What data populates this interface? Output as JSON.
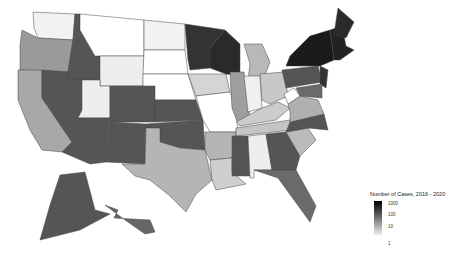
{
  "chart_data": {
    "type": "choropleth",
    "title": "",
    "legend": {
      "title": "Number of Cases, 2016 - 2020",
      "scale": "log",
      "ticks": [
        "1000",
        "100",
        "10",
        "1"
      ]
    },
    "states": {
      "WA": "#f2f2f2",
      "OR": "#9a9a9a",
      "CA": "#a8a8a8",
      "ID": "#555555",
      "NV": "#555555",
      "MT": "#ffffff",
      "WY": "#eeeeee",
      "UT": "#eeeeee",
      "AZ": "#555555",
      "CO": "#555555",
      "NM": "#555555",
      "ND": "#f2f2f2",
      "SD": "#ffffff",
      "NE": "#ffffff",
      "KS": "#555555",
      "OK": "#555555",
      "TX": "#b5b5b5",
      "MN": "#333333",
      "IA": "#d5d5d5",
      "MO": "#ffffff",
      "AR": "#b5b5b5",
      "LA": "#cfcfcf",
      "WI": "#2a2a2a",
      "IL": "#9e9e9e",
      "MI": "#b8b8b8",
      "IN": "#f0f0f0",
      "OH": "#c8c8c8",
      "KY": "#cccccc",
      "TN": "#c4c4c4",
      "MS": "#555555",
      "AL": "#eeeeee",
      "GA": "#555555",
      "FL": "#6a6a6a",
      "SC": "#bbbbbb",
      "NC": "#555555",
      "VA": "#b0b0b0",
      "WV": "#ffffff",
      "PA": "#555555",
      "NY": "#1a1a1a",
      "NE_US": "#222222",
      "ME": "#2a2a2a",
      "NJ": "#333333",
      "MD": "#6a6a6a",
      "AK": "#555555",
      "HI": "#666666"
    }
  }
}
